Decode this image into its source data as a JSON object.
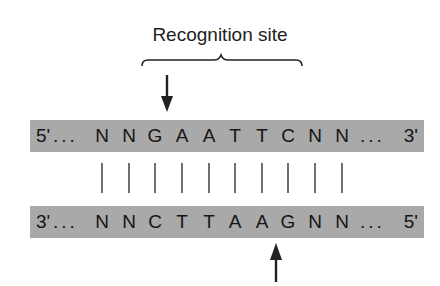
{
  "title": "Recognition site",
  "top_strand": {
    "left_end": "5'",
    "right_end": "3'",
    "bases": [
      "N",
      "N",
      "G",
      "A",
      "A",
      "T",
      "T",
      "C",
      "N",
      "N"
    ]
  },
  "bottom_strand": {
    "left_end": "3'",
    "right_end": "5'",
    "bases": [
      "N",
      "N",
      "C",
      "T",
      "T",
      "A",
      "A",
      "G",
      "N",
      "N"
    ]
  },
  "ellipsis": "...",
  "cut_sites": {
    "top": "between N and G (arrow above G)",
    "bottom": "between A and G (arrow below G)"
  },
  "colors": {
    "strand_fill": "#a9a9a9",
    "text": "#151515",
    "lines": "#333333"
  }
}
